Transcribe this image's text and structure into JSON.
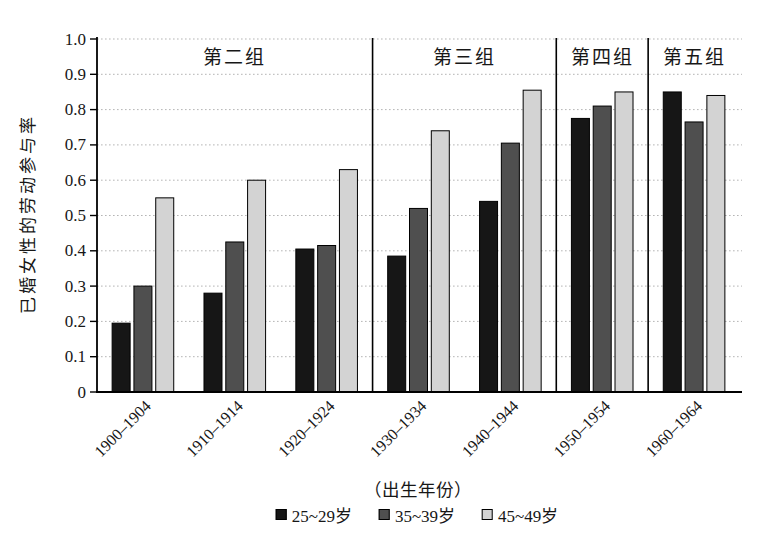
{
  "chart_data": {
    "type": "bar",
    "title": "",
    "ylabel": "已婚女性的劳动参与率",
    "xlabel": "（出生年份）",
    "ylim": [
      0,
      1.0
    ],
    "ytick_labels": [
      "1.0",
      "0.9",
      "0.8",
      "0.7",
      "0.6",
      "0.5",
      "0.4",
      "0.3",
      "0.2",
      "0.1",
      "0"
    ],
    "grid": "horizontal-dotted",
    "legend_position": "bottom",
    "categories": [
      "1900–1904",
      "1910–1914",
      "1920–1924",
      "1930–1934",
      "1940–1944",
      "1950–1954",
      "1960–1964"
    ],
    "series": [
      {
        "name": "25~29岁",
        "color": "#161616",
        "values": [
          0.195,
          0.28,
          0.405,
          0.385,
          0.54,
          0.775,
          0.85
        ]
      },
      {
        "name": "35~39岁",
        "color": "#4f4f4f",
        "values": [
          0.3,
          0.425,
          0.415,
          0.52,
          0.705,
          0.81,
          0.765
        ]
      },
      {
        "name": "45~49岁",
        "color": "#d3d3d3",
        "values": [
          0.55,
          0.6,
          0.63,
          0.74,
          0.855,
          0.85,
          0.84
        ]
      }
    ],
    "group_annotations": [
      {
        "label": "第二组",
        "start_category": 0,
        "end_category": 2
      },
      {
        "label": "第三组",
        "start_category": 3,
        "end_category": 4
      },
      {
        "label": "第四组",
        "start_category": 5,
        "end_category": 5
      },
      {
        "label": "第五组",
        "start_category": 6,
        "end_category": 6
      }
    ],
    "colors": {
      "axis": "#000000",
      "gridline": "#b5b5b5",
      "divider": "#000000",
      "bar_outline": "#000000"
    }
  }
}
